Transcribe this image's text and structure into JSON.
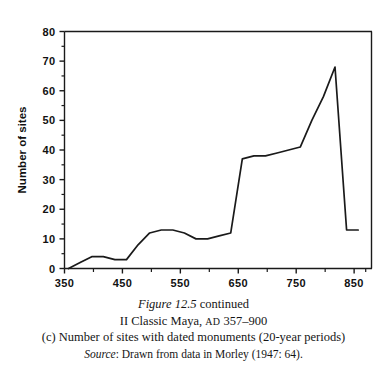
{
  "figure": {
    "caption_figure_label": "Figure 12.5",
    "caption_figure_suffix": " continued",
    "caption_subtitle_pre": "II Classic Maya, ",
    "caption_subtitle_era": "AD",
    "caption_subtitle_post": " 357–900",
    "caption_description": "(c) Number of sites with dated monuments (20-year periods)",
    "caption_source_label": "Source",
    "caption_source_text": ": Drawn from data in Morley (1947: 64)."
  },
  "chart_data": {
    "type": "line",
    "title": "",
    "xlabel": "",
    "ylabel": "Number of sites",
    "xlim": [
      350,
      880
    ],
    "ylim": [
      0,
      80
    ],
    "grid": false,
    "legend": null,
    "x_major_ticks": [
      350,
      450,
      550,
      650,
      750,
      850
    ],
    "x_minor_ticks": [
      400,
      500,
      600,
      700,
      800
    ],
    "x_tick_labels": [
      "350",
      "450",
      "550",
      "650",
      "750",
      "850"
    ],
    "y_major_ticks": [
      0,
      10,
      20,
      30,
      40,
      50,
      60,
      70,
      80
    ],
    "y_minor_ticks": [
      5,
      15,
      25,
      35,
      45,
      55,
      65,
      75
    ],
    "y_tick_labels": [
      "0",
      "10",
      "20",
      "30",
      "40",
      "50",
      "60",
      "70",
      "80"
    ],
    "line_color": "#1a1a1a",
    "line_width": 1.7,
    "x": [
      357,
      377,
      397,
      417,
      437,
      457,
      477,
      497,
      517,
      537,
      557,
      577,
      597,
      617,
      637,
      657,
      677,
      697,
      717,
      737,
      757,
      777,
      797,
      817,
      837,
      857
    ],
    "values": [
      0,
      2,
      4,
      4,
      3,
      3,
      8,
      12,
      13,
      13,
      12,
      10,
      10,
      11,
      12,
      37,
      38,
      38,
      39,
      40,
      41,
      50,
      58,
      68,
      13,
      13
    ],
    "series": [
      {
        "name": "Number of sites with dated monuments",
        "values": [
          0,
          2,
          4,
          4,
          3,
          3,
          8,
          12,
          13,
          13,
          12,
          10,
          10,
          11,
          12,
          37,
          38,
          38,
          39,
          40,
          41,
          50,
          58,
          68,
          13,
          13
        ]
      }
    ]
  }
}
